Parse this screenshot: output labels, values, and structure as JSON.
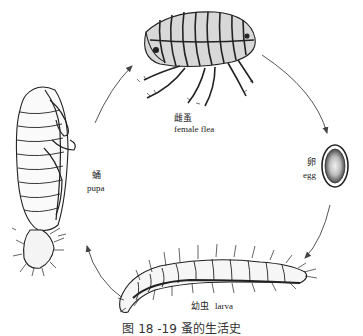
{
  "diagram": {
    "stages": [
      {
        "id": "female_flea",
        "label_zh": "雌蚤",
        "label_en": "female flea"
      },
      {
        "id": "egg",
        "label_zh": "卵",
        "label_en": "egg"
      },
      {
        "id": "larva",
        "label_zh": "幼虫",
        "label_en": "larva"
      },
      {
        "id": "pupa",
        "label_zh": "蛹",
        "label_en": "pupa"
      }
    ],
    "cycle_direction": "clockwise",
    "arrows": [
      {
        "from": "female_flea",
        "to": "egg"
      },
      {
        "from": "egg",
        "to": "larva"
      },
      {
        "from": "larva",
        "to": "pupa"
      },
      {
        "from": "pupa",
        "to": "female_flea"
      }
    ],
    "caption": "图 18 -19   蚤的生活史"
  },
  "colors": {
    "ink": "#222222",
    "background": "#ffffff",
    "arrow": "#555555"
  }
}
